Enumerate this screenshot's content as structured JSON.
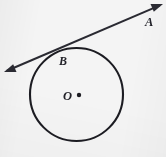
{
  "figure": {
    "type": "geometry-diagram",
    "background_color": "#f4f4f4",
    "ink_color": "#23232a",
    "width": 166,
    "height": 157,
    "labels": {
      "a": "A",
      "b": "B",
      "o": "O"
    },
    "circle": {
      "center_x": 76.5,
      "center_y": 94.5,
      "radius": 46.5,
      "stroke_width": 2.1,
      "stroke_color": "#1c1c22",
      "fill": "none"
    },
    "center_dot": {
      "cx": 79,
      "cy": 95,
      "r": 2.2,
      "color": "#1c1c22"
    },
    "tangent_line": {
      "x1": 4,
      "y1": 72,
      "x2": 163,
      "y2": 4,
      "stroke_width": 2.0,
      "stroke_color": "#2a2a32",
      "arrowheads": "both",
      "tangent_point_x": 56,
      "tangent_point_y": 49
    }
  }
}
